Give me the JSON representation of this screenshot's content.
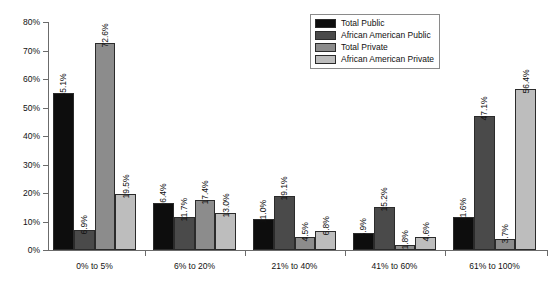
{
  "chart_data": {
    "type": "bar",
    "title": "",
    "subtitle": "",
    "xlabel": "",
    "ylabel": "",
    "ylim": [
      0,
      80
    ],
    "grid": false,
    "legend_position": "top-right",
    "categories": [
      "0% to 5%",
      "6% to 20%",
      "21% to 40%",
      "41% to 60%",
      "61% to 100%"
    ],
    "y_ticks": [
      "0%",
      "10%",
      "20%",
      "30%",
      "40%",
      "50%",
      "60%",
      "70%",
      "80%"
    ],
    "y_tick_values": [
      0,
      10,
      20,
      30,
      40,
      50,
      60,
      70,
      80
    ],
    "series": [
      {
        "name": "Total Public",
        "color": "#0d0d0d",
        "values": [
          55.1,
          16.4,
          11.0,
          5.9,
          11.6
        ],
        "labels": [
          "55.1%",
          "16.4%",
          "11.0%",
          "5.9%",
          "11.6%"
        ]
      },
      {
        "name": "African American Public",
        "color": "#4a4a4a",
        "values": [
          6.9,
          11.7,
          19.1,
          15.2,
          47.1
        ],
        "labels": [
          "6.9%",
          "11.7%",
          "19.1%",
          "15.2%",
          "47.1%"
        ]
      },
      {
        "name": "Total Private",
        "color": "#8c8c8c",
        "values": [
          72.6,
          17.4,
          4.5,
          1.8,
          3.7
        ],
        "labels": [
          "72.6%",
          "17.4%",
          "4.5%",
          "1.8%",
          "3.7%"
        ]
      },
      {
        "name": "African American Private",
        "color": "#bdbdbd",
        "values": [
          19.5,
          13.0,
          6.8,
          4.6,
          56.4
        ],
        "labels": [
          "19.5%",
          "13.0%",
          "6.8%",
          "4.6%",
          "56.4%"
        ]
      }
    ]
  },
  "legend": {
    "items": [
      {
        "label": "Total Public",
        "color": "#0d0d0d"
      },
      {
        "label": "African American Public",
        "color": "#4a4a4a"
      },
      {
        "label": "Total Private",
        "color": "#8c8c8c"
      },
      {
        "label": "African American Private",
        "color": "#bdbdbd"
      }
    ]
  }
}
